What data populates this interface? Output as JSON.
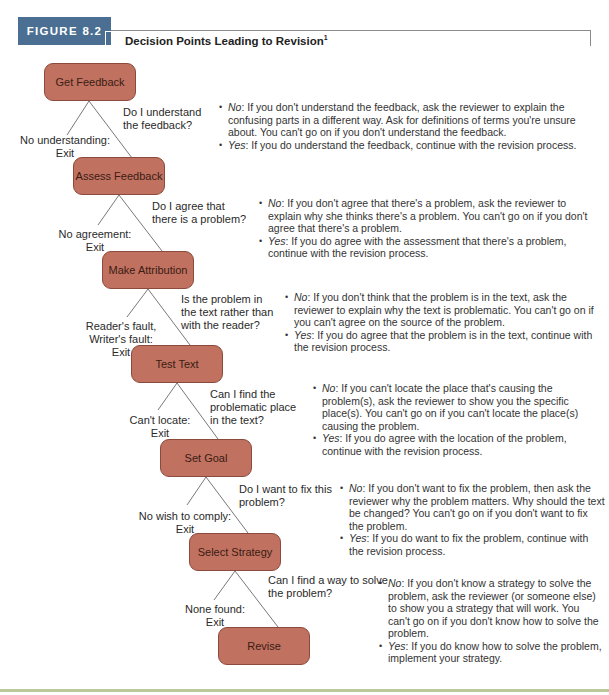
{
  "header": {
    "figure_label": "FIGURE 8.2",
    "title": "Decision Points Leading to Revision",
    "footnote_marker": "1"
  },
  "colors": {
    "figure_tab": "#4a6f92",
    "node_fill": "#c0715f",
    "node_border": "#8c4a3c",
    "bottom_rule": "#b9c79a"
  },
  "nodes": [
    {
      "label": "Get Feedback"
    },
    {
      "label": "Assess Feedback"
    },
    {
      "label": "Make Attribution"
    },
    {
      "label": "Test Text"
    },
    {
      "label": "Set Goal"
    },
    {
      "label": "Select Strategy"
    },
    {
      "label": "Revise"
    }
  ],
  "steps": [
    {
      "question": "Do I understand the feedback?",
      "exit_label": "No understanding:",
      "exit": "Exit",
      "no_label": "No",
      "no_text": ": If you don't understand the feedback, ask the reviewer to explain the confusing parts in a different way. Ask for definitions of terms you're unsure about. You can't go on if you don't understand the feedback.",
      "yes_label": "Yes",
      "yes_text": ": If you do understand the feedback, continue with the revision process."
    },
    {
      "question": "Do I agree that there is a problem?",
      "exit_label": "No agreement:",
      "exit": "Exit",
      "no_label": "No",
      "no_text": ": If you don't agree that there's a problem, ask the reviewer to explain why she thinks there's a problem. You can't go on if you don't agree that there's a problem.",
      "yes_label": "Yes",
      "yes_text": ": If you do agree with the assessment that there's a problem, continue with the revision process."
    },
    {
      "question": "Is the problem in the text rather than with the reader?",
      "exit_label": "Reader's fault, Writer's fault:",
      "exit": "Exit",
      "no_label": "No",
      "no_text": ": If you don't think that the problem is in the text, ask the reviewer to explain why the text is problematic. You can't go on if you can't agree on the source of the problem.",
      "yes_label": "Yes",
      "yes_text": ": If you do agree that the problem is in the text, continue with the revision process."
    },
    {
      "question": "Can I find the problematic place in the text?",
      "exit_label": "Can't locate:",
      "exit": "Exit",
      "no_label": "No",
      "no_text": ": If you can't locate the place that's causing the problem(s), ask the reviewer to show you the specific place(s). You can't go on if you can't locate the place(s) causing the problem.",
      "yes_label": "Yes",
      "yes_text": ": If you do agree with the location of the problem, continue with the revision process."
    },
    {
      "question": "Do I want to fix this problem?",
      "exit_label": "No wish to comply:",
      "exit": "Exit",
      "no_label": "No",
      "no_text": ": If you don't want to fix the problem, then ask the reviewer why the problem matters. Why should the text be changed? You can't go on if you don't want to fix the problem.",
      "yes_label": "Yes",
      "yes_text": ": If you do want to fix the problem, continue with the revision process."
    },
    {
      "question": "Can I find a way to solve the problem?",
      "exit_label": "None found:",
      "exit": "Exit",
      "no_label": "No",
      "no_text": ": If you don't know a strategy to solve the problem, ask the reviewer (or someone else) to show you a strategy that will work. You can't go on if you don't know how to solve the problem.",
      "yes_label": "Yes",
      "yes_text": ": If you do know how to solve the problem, implement your strategy."
    }
  ]
}
